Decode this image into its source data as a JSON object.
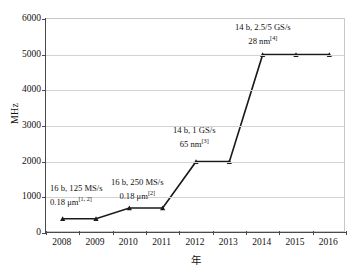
{
  "chart_data": {
    "type": "line",
    "title": "",
    "xlabel": "年",
    "ylabel": "MHz",
    "categories": [
      "2008",
      "2009",
      "2010",
      "2011",
      "2012",
      "2013",
      "2014",
      "2015",
      "2016"
    ],
    "values": [
      400,
      400,
      700,
      700,
      2000,
      2000,
      5000,
      5000,
      5000
    ],
    "series": [
      {
        "name": "",
        "values": [
          400,
          400,
          700,
          700,
          2000,
          2000,
          5000,
          5000,
          5000
        ]
      }
    ],
    "ylim": [
      0,
      6000
    ],
    "yticks": [
      0,
      1000,
      2000,
      3000,
      4000,
      5000,
      6000
    ],
    "ytick_labels": [
      "0",
      "1000",
      "2000",
      "3000",
      "4000",
      "5000",
      "6000"
    ],
    "grid": true,
    "legend": "none",
    "marker": "filled-triangle-dot",
    "line_color": "#1a1a1a",
    "grid_color": "#d3d3d3",
    "annotations": [
      {
        "id": "ann-1",
        "line1": "16 b, 125 MS/s",
        "line2": "0.18 μm",
        "ref": "[1, 2]",
        "points_to": "2008"
      },
      {
        "id": "ann-2",
        "line1": "16 b, 250 MS/s",
        "line2": "0.18 μm",
        "ref": "[2]",
        "points_to": "2010"
      },
      {
        "id": "ann-3",
        "line1": "14 b, 1 GS/s",
        "line2": "65 nm",
        "ref": "[3]",
        "points_to": "2012"
      },
      {
        "id": "ann-4",
        "line1": "14 b, 2.5/5 GS/s",
        "line2": "28 nm",
        "ref": "[4]",
        "points_to": "2014"
      }
    ]
  }
}
